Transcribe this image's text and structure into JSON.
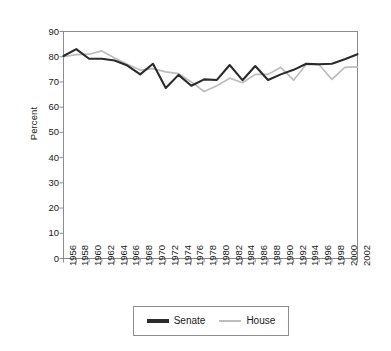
{
  "chart_data": {
    "type": "line",
    "title": "",
    "subtitle": "",
    "xlabel": "",
    "ylabel": "Percent",
    "ylim": [
      0,
      90
    ],
    "ytick_step": 10,
    "yticks": [
      0,
      10,
      20,
      30,
      40,
      50,
      60,
      70,
      80,
      90
    ],
    "grid": false,
    "legend_position": "bottom",
    "x": [
      1956,
      1958,
      1960,
      1962,
      1964,
      1966,
      1968,
      1970,
      1972,
      1974,
      1976,
      1978,
      1980,
      1982,
      1984,
      1986,
      1988,
      1990,
      1992,
      1994,
      1996,
      1998,
      2000,
      2002
    ],
    "categories": [
      "1956",
      "1958",
      "1960",
      "1962",
      "1964",
      "1966",
      "1968",
      "1970",
      "1972",
      "1974",
      "1976",
      "1978",
      "1980",
      "1982",
      "1984",
      "1986",
      "1988",
      "1990",
      "1992",
      "1994",
      "1996",
      "1998",
      "2000",
      "2002"
    ],
    "series": [
      {
        "name": "Senate",
        "color": "#2b2b2b",
        "values": [
          80.3,
          83.0,
          79.2,
          79.2,
          78.5,
          76.5,
          73.0,
          77.2,
          67.6,
          72.8,
          68.5,
          71.0,
          70.8,
          76.7,
          70.7,
          76.3,
          70.8,
          73.0,
          74.8,
          77.2,
          77.0,
          77.2,
          79.0,
          81.0
        ]
      },
      {
        "name": "House",
        "color": "#bdbdbd",
        "values": [
          80.0,
          80.8,
          81.0,
          82.3,
          79.5,
          77.0,
          74.7,
          75.3,
          74.0,
          73.3,
          70.0,
          66.2,
          68.5,
          71.5,
          69.7,
          73.0,
          73.0,
          75.8,
          70.7,
          77.0,
          76.8,
          71.0,
          75.8,
          76.0
        ]
      }
    ]
  },
  "legend": {
    "items": [
      {
        "label": "Senate",
        "color": "#2b2b2b"
      },
      {
        "label": "House",
        "color": "#bdbdbd"
      }
    ]
  },
  "axes": {
    "y_title": "Percent",
    "y_tick_labels": [
      "90",
      "80",
      "70",
      "60",
      "50",
      "40",
      "30",
      "20",
      "10",
      "0"
    ],
    "x_tick_labels": [
      "1956",
      "1958",
      "1960",
      "1962",
      "1964",
      "1966",
      "1968",
      "1970",
      "1972",
      "1974",
      "1976",
      "1978",
      "1980",
      "1982",
      "1984",
      "1986",
      "1988",
      "1990",
      "1992",
      "1994",
      "1996",
      "1998",
      "2000",
      "2002"
    ]
  }
}
